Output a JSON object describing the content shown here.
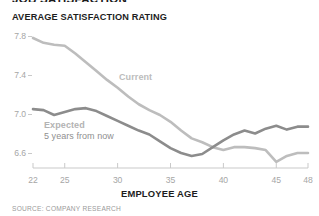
{
  "header": {
    "title": "JOB SATISFACTION",
    "subtitle": "AVERAGE SATISFACTION RATING"
  },
  "source_note": "SOURCE: COMPANY RESEARCH",
  "annotations": {
    "current_label": "Current",
    "expected_label": "Expected",
    "expected_sublabel": "5 years from now"
  },
  "colors": {
    "current_line": "#bdbdbd",
    "expected_line": "#8c8c8c",
    "axis": "#c9c9c9",
    "tick_text": "#a6a6a6",
    "heading_text": "#1d1d1d"
  },
  "chart_data": {
    "type": "line",
    "title": "AVERAGE SATISFACTION RATING",
    "xlabel": "EMPLOYEE AGE",
    "ylabel": "",
    "xlim": [
      22,
      48
    ],
    "ylim": [
      6.4,
      7.9
    ],
    "xticks": [
      22,
      25,
      30,
      35,
      40,
      45,
      48
    ],
    "yticks": [
      6.6,
      7.0,
      7.4,
      7.8
    ],
    "ytick_labels": [
      "6.6",
      "7.0",
      "7.4",
      "7.8"
    ],
    "xtick_labels": [
      "22",
      "25",
      "30",
      "35",
      "40",
      "45",
      "48"
    ],
    "grid": false,
    "legend": "inline-annotations",
    "x": [
      22,
      23,
      24,
      25,
      26,
      27,
      28,
      29,
      30,
      31,
      32,
      33,
      34,
      35,
      36,
      37,
      38,
      39,
      40,
      41,
      42,
      43,
      44,
      45,
      46,
      47,
      48
    ],
    "series": [
      {
        "name": "Current",
        "color": "#bdbdbd",
        "values": [
          7.78,
          7.73,
          7.71,
          7.7,
          7.62,
          7.53,
          7.44,
          7.35,
          7.27,
          7.18,
          7.1,
          7.04,
          6.99,
          6.92,
          6.83,
          6.75,
          6.71,
          6.66,
          6.63,
          6.66,
          6.66,
          6.65,
          6.63,
          6.51,
          6.57,
          6.6,
          6.6
        ]
      },
      {
        "name": "Expected 5 years from now",
        "color": "#8c8c8c",
        "values": [
          7.05,
          7.04,
          6.99,
          7.02,
          7.05,
          7.06,
          7.03,
          6.98,
          6.93,
          6.88,
          6.83,
          6.79,
          6.72,
          6.65,
          6.6,
          6.57,
          6.59,
          6.66,
          6.73,
          6.79,
          6.83,
          6.8,
          6.85,
          6.88,
          6.84,
          6.87,
          6.87
        ]
      }
    ]
  }
}
